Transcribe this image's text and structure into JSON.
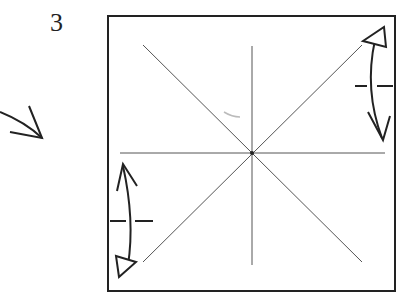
{
  "diagram": {
    "step_number": "3",
    "colors": {
      "line": "#222222",
      "crease": "#555555"
    }
  }
}
